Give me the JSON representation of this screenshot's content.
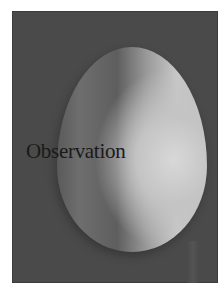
{
  "photo": {
    "subject": "egg",
    "caption": "Observation",
    "colors": {
      "background": "#4a4a4a",
      "highlight": "#d8d8d8",
      "caption": "#1a1a1a"
    }
  }
}
